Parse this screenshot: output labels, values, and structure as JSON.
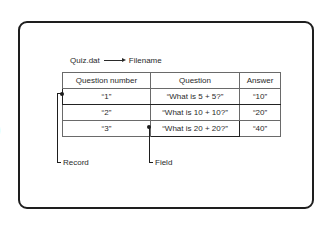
{
  "edge_glyph": ")",
  "file": {
    "name": "Quiz.dat",
    "label": "Filename",
    "arrow_icon": "right-arrow-icon"
  },
  "table": {
    "headers": [
      "Question number",
      "Question",
      "Answer"
    ],
    "rows": [
      [
        "“1”",
        "“What is 5 + 5?”",
        "“10”"
      ],
      [
        "“2”",
        "“What is 10 + 10?”",
        "“20”"
      ],
      [
        "“3”",
        "“What is 20 + 20?”",
        "“40”"
      ]
    ],
    "highlighted_record_row": 0,
    "highlighted_field": {
      "row": 2,
      "col": 1
    }
  },
  "callouts": {
    "record": "Record",
    "field": "Field"
  }
}
